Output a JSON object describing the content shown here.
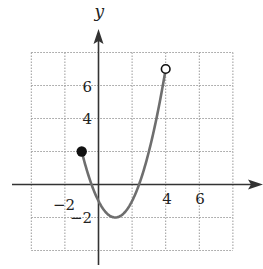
{
  "chart_data": {
    "type": "line",
    "title": "",
    "xlabel": "",
    "ylabel": "y",
    "xlim": [
      -4,
      8
    ],
    "ylim": [
      -4,
      8
    ],
    "grid": true,
    "grid_step": 2,
    "x_ticks": [
      -2,
      4,
      6
    ],
    "x_tick_labels": [
      "−2",
      "4",
      "6"
    ],
    "y_ticks": [
      -2,
      4,
      6
    ],
    "y_tick_labels": [
      "−2",
      "4",
      "6"
    ],
    "series": [
      {
        "name": "f(x) = (x - 1)^2 - 2",
        "domain": [
          -1,
          4
        ],
        "color": "#6e6e6e",
        "points": [
          {
            "x": -1,
            "y": 2
          },
          {
            "x": -0.41,
            "y": 0
          },
          {
            "x": 0,
            "y": -1
          },
          {
            "x": 1,
            "y": -2
          },
          {
            "x": 2,
            "y": -1
          },
          {
            "x": 2.41,
            "y": 0
          },
          {
            "x": 3,
            "y": 2
          },
          {
            "x": 4,
            "y": 7
          }
        ]
      }
    ],
    "endpoints": [
      {
        "x": -1,
        "y": 2,
        "style": "closed"
      },
      {
        "x": 4,
        "y": 7,
        "style": "open"
      }
    ]
  },
  "axes": {
    "y_label": "y",
    "x_ticks": [
      {
        "value": -2,
        "label": "−2"
      },
      {
        "value": 4,
        "label": "4"
      },
      {
        "value": 6,
        "label": "6"
      }
    ],
    "y_ticks": [
      {
        "value": 6,
        "label": "6"
      },
      {
        "value": 4,
        "label": "4"
      },
      {
        "value": -2,
        "label": "−2"
      }
    ]
  },
  "colors": {
    "axis": "#333333",
    "grid": "#9a9a9a",
    "curve": "#6e6e6e",
    "dot": "#111111"
  }
}
